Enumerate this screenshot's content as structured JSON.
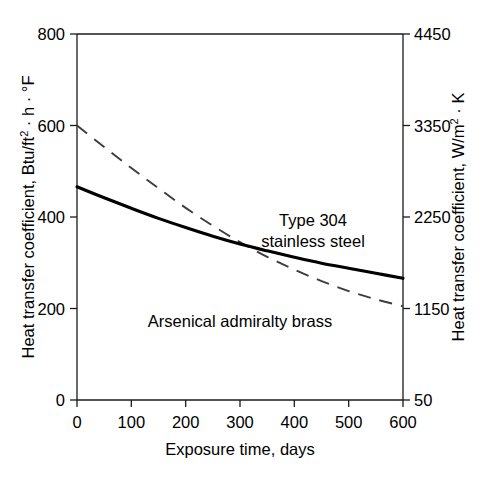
{
  "chart_data": {
    "type": "line",
    "title": "",
    "subtitle": "",
    "xlabel": "Exposure time, days",
    "ylabel": "Heat transfer coefficient, Btu/ft² · h · °F",
    "ylabel_right": "Heat transfer coefficient, W/m² · K",
    "xlim": [
      0,
      600
    ],
    "ylim": [
      0,
      800
    ],
    "ylim_right": [
      50,
      4450
    ],
    "xticks": [
      0,
      100,
      200,
      300,
      400,
      500,
      600
    ],
    "xticklabels": [
      "0",
      "100",
      "200",
      "300",
      "400",
      "500",
      "600"
    ],
    "yticks": [
      0,
      200,
      400,
      600,
      800
    ],
    "yticklabels": [
      "0",
      "200",
      "400",
      "600",
      "800"
    ],
    "yticks_right": [
      50,
      1150,
      2250,
      3350,
      4450
    ],
    "yticklabels_right": [
      "50",
      "1150",
      "2250",
      "3350",
      "4450"
    ],
    "grid": false,
    "legend_position": "inline-annotations",
    "series": [
      {
        "name": "Type 304 stainless steel",
        "style": "solid",
        "color": "#000000",
        "annotation": "Type 304\nstainless steel",
        "x": [
          0,
          50,
          100,
          150,
          200,
          250,
          300,
          350,
          400,
          450,
          500,
          550,
          600
        ],
        "values": [
          466,
          442,
          419,
          397,
          377,
          358,
          341,
          326,
          312,
          299,
          288,
          277,
          266
        ]
      },
      {
        "name": "Arsenical admiralty brass",
        "style": "dashed",
        "color": "#3d3d3d",
        "annotation": "Arsenical admiralty brass",
        "x": [
          0,
          50,
          100,
          150,
          200,
          250,
          300,
          350,
          400,
          450,
          500,
          550,
          600
        ],
        "values": [
          600,
          553,
          507,
          463,
          420,
          381,
          345,
          313,
          285,
          260,
          238,
          220,
          205
        ]
      }
    ],
    "annotations": [
      {
        "text_line1": "Type 304",
        "text_line2": "stainless steel",
        "series": "Type 304 stainless steel"
      },
      {
        "text_line1": "Arsenical admiralty brass",
        "text_line2": "",
        "series": "Arsenical admiralty brass"
      }
    ]
  },
  "axes": {
    "left_title_part1": "Heat transfer coefficient, Btu/ft",
    "left_title_sup": "2",
    "left_title_part2": " · h · °F",
    "right_title_part1": "Heat transfer coefficient, W/m",
    "right_title_sup": "2",
    "right_title_part2": " · K",
    "bottom_title": "Exposure time, days"
  },
  "ticklabels": {
    "left": {
      "t0": "0",
      "t1": "200",
      "t2": "400",
      "t3": "600",
      "t4": "800"
    },
    "right": {
      "t0": "50",
      "t1": "1150",
      "t2": "2250",
      "t3": "3350",
      "t4": "4450"
    },
    "bottom": {
      "t0": "0",
      "t1": "100",
      "t2": "200",
      "t3": "300",
      "t4": "400",
      "t5": "500",
      "t6": "600"
    }
  },
  "labels": {
    "steel_line1": "Type 304",
    "steel_line2": "stainless steel",
    "brass": "Arsenical admiralty brass"
  },
  "colors": {
    "axis": "#1a1a1a",
    "solid_curve": "#000000",
    "dashed_curve": "#3d3d3d",
    "background": "#ffffff"
  }
}
